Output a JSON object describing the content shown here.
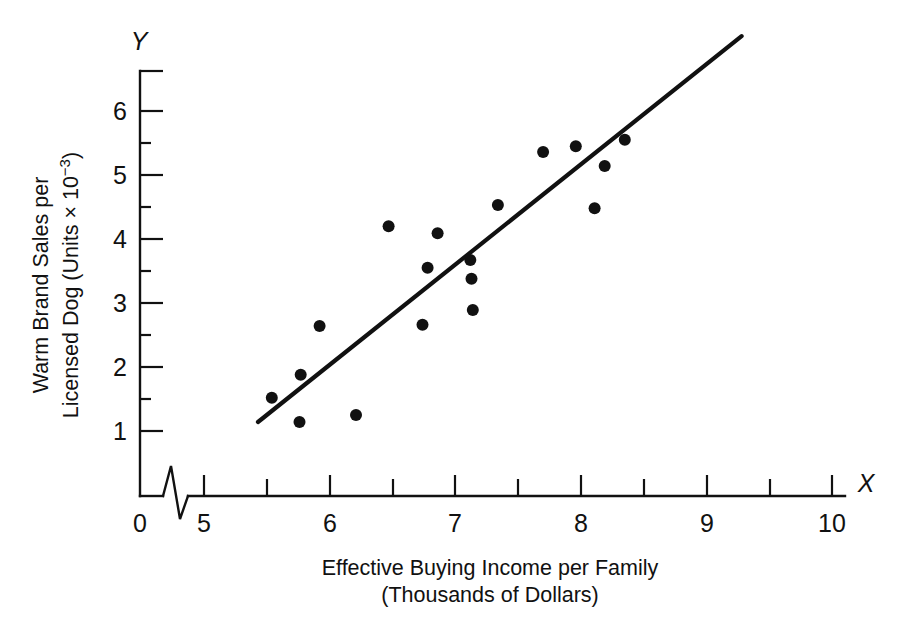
{
  "chart_data": {
    "type": "scatter",
    "title": "",
    "xlabel": "Effective Buying Income per Family (Thousands of Dollars)",
    "xlabel_line1": "Effective Buying Income per Family",
    "xlabel_line2": "(Thousands of Dollars)",
    "ylabel": "Warm Brand Sales per Licensed Dog (Units × 10⁻³)",
    "ylabel_line1": "Warm Brand Sales per",
    "ylabel_line2_prefix": "Licensed Dog (Units × 10",
    "ylabel_line2_exponent": "−3",
    "ylabel_line2_suffix": ")",
    "x_axis_letter": "X",
    "y_axis_letter": "Y",
    "xlim": [
      4.8,
      10.35
    ],
    "ylim": [
      0,
      6.6
    ],
    "x_origin_label": "0",
    "x_ticks": [
      5,
      6,
      7,
      8,
      9,
      10
    ],
    "x_tick_labels": [
      "5",
      "6",
      "7",
      "8",
      "9",
      "10"
    ],
    "x_minor_ticks": [
      5.5,
      6.5,
      7.5,
      8.5,
      9.5
    ],
    "y_ticks": [
      1,
      2,
      3,
      4,
      5,
      6
    ],
    "y_tick_labels": [
      "1",
      "2",
      "3",
      "4",
      "5",
      "6"
    ],
    "y_minor_ticks": [
      1.5,
      2.5,
      3.5,
      4.5,
      5.5,
      6.5
    ],
    "grid": false,
    "legend": false,
    "axis_break": true,
    "axis_break_note": "zig-zag break on X axis between 0 and 5",
    "points": [
      {
        "x": 5.54,
        "y": 1.52
      },
      {
        "x": 5.77,
        "y": 1.88
      },
      {
        "x": 5.76,
        "y": 1.14
      },
      {
        "x": 5.92,
        "y": 2.64
      },
      {
        "x": 6.21,
        "y": 1.25
      },
      {
        "x": 6.47,
        "y": 4.2
      },
      {
        "x": 6.74,
        "y": 2.66
      },
      {
        "x": 6.78,
        "y": 3.55
      },
      {
        "x": 6.86,
        "y": 4.09
      },
      {
        "x": 7.12,
        "y": 3.67
      },
      {
        "x": 7.13,
        "y": 3.38
      },
      {
        "x": 7.14,
        "y": 2.89
      },
      {
        "x": 7.34,
        "y": 4.53
      },
      {
        "x": 7.7,
        "y": 5.36
      },
      {
        "x": 7.96,
        "y": 5.45
      },
      {
        "x": 8.11,
        "y": 4.48
      },
      {
        "x": 8.19,
        "y": 5.14
      },
      {
        "x": 8.35,
        "y": 5.55
      }
    ],
    "fit_line": {
      "name": "regression line",
      "x_start": 5.43,
      "y_start": 1.14,
      "x_end": 9.28,
      "y_end": 7.17
    },
    "marker": {
      "shape": "circle",
      "radius_px": 6,
      "color": "#111111"
    },
    "line_color": "#111111",
    "background_color": "#ffffff"
  }
}
